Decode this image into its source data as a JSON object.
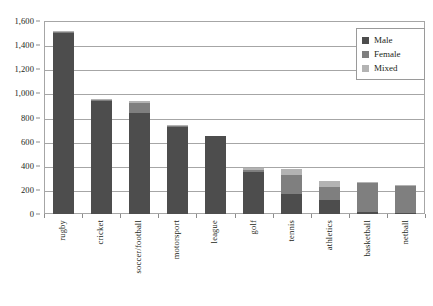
{
  "chart_data": {
    "type": "bar",
    "subtype": "stacked-bar",
    "title": "",
    "xlabel": "",
    "ylabel": "",
    "ylim": [
      0,
      1600
    ],
    "ytick_step": 200,
    "ytick_labels": [
      "0",
      "200",
      "400",
      "600",
      "800",
      "1,000",
      "1,200",
      "1,400",
      "1,600"
    ],
    "ytick_values": [
      0,
      200,
      400,
      600,
      800,
      1000,
      1200,
      1400,
      1600
    ],
    "grid": true,
    "grid_axis": "y",
    "legend_position": "top-right",
    "categories": [
      "rugby",
      "cricket",
      "soccer/football",
      "motorsport",
      "league",
      "golf",
      "tennis",
      "athletics",
      "basketball",
      "netball"
    ],
    "series": [
      {
        "name": "Male",
        "color": "#4d4d4d",
        "values": [
          1500,
          940,
          840,
          725,
          645,
          350,
          165,
          120,
          15,
          10
        ]
      },
      {
        "name": "Female",
        "color": "#7f7f7f",
        "values": [
          10,
          5,
          80,
          5,
          0,
          15,
          155,
          100,
          240,
          225
        ]
      },
      {
        "name": "Mixed",
        "color": "#b3b3b3",
        "values": [
          5,
          10,
          15,
          5,
          0,
          20,
          55,
          50,
          10,
          5
        ]
      }
    ],
    "totals": [
      1515,
      955,
      935,
      735,
      645,
      385,
      375,
      270,
      265,
      240
    ]
  },
  "legend": {
    "items": [
      {
        "label": "Male",
        "color": "#4d4d4d"
      },
      {
        "label": "Female",
        "color": "#7f7f7f"
      },
      {
        "label": "Mixed",
        "color": "#b3b3b3"
      }
    ]
  },
  "axes": {
    "frame_color": "#a6a6a6",
    "tick_color": "#8c8c8c",
    "text_color": "#231f20"
  }
}
